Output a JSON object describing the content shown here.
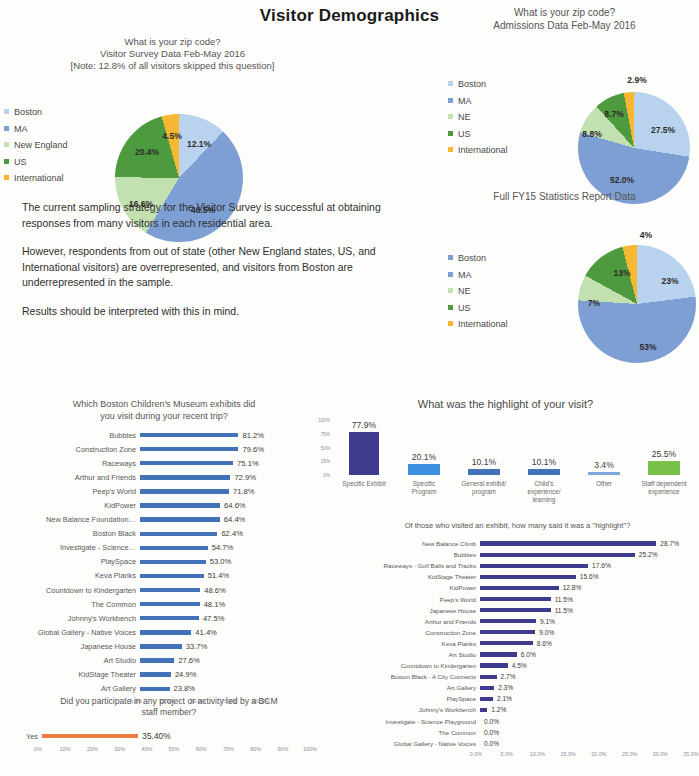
{
  "title": "Visitor Demographics",
  "colors": {
    "boston": "#b9d3ee",
    "ma": "#7e9fd4",
    "ne": "#c3e0b1",
    "us": "#4e9a3f",
    "international": "#f6b games",
    "intl": "#f7b731",
    "bar_blue": "#4472b8",
    "bar_navy": "#3f3b8f",
    "bar_green": "#78c24a",
    "bar_orange": "#ed7d42",
    "bar_brightblue": "#3f8fe0"
  },
  "pie_survey": {
    "chart_data": {
      "type": "pie",
      "title": "What is your zip code?\nVisitor Survey Data Feb-May 2016\n[Note: 12.8% of all visitors skipped this question]",
      "title_lines": [
        "What is your zip code?",
        "Visitor Survey Data Feb-May 2016",
        "[Note: 12.8% of all visitors skipped this question]"
      ],
      "categories": [
        "Boston",
        "MA",
        "New England",
        "US",
        "International"
      ],
      "values": [
        12.1,
        46.5,
        16.6,
        20.4,
        4.5
      ],
      "labels": [
        "12.1%",
        "46.5%",
        "16.6%",
        "20.4%",
        "4.5%"
      ],
      "colors": [
        "#b9d3ee",
        "#7e9fd4",
        "#c3e0b1",
        "#4e9a3f",
        "#f7b731"
      ],
      "legend": [
        "Boston",
        "MA",
        "New England",
        "US",
        "International"
      ],
      "legend_position": "left"
    }
  },
  "pie_admissions": {
    "chart_data": {
      "type": "pie",
      "title_lines": [
        "What is your zip code?",
        "Admissions Data Feb-May 2016"
      ],
      "categories": [
        "Boston",
        "MA",
        "NE",
        "US",
        "International"
      ],
      "values": [
        27.5,
        52.0,
        8.8,
        8.7,
        2.9
      ],
      "labels": [
        "27.5%",
        "52.0%",
        "8.8%",
        "8.7%",
        "2.9%"
      ],
      "colors": [
        "#b9d3ee",
        "#7e9fd4",
        "#c3e0b1",
        "#4e9a3f",
        "#f7b731"
      ],
      "legend": [
        "Boston",
        "MA",
        "NE",
        "US",
        "International"
      ],
      "legend_position": "left"
    }
  },
  "pie_fy15": {
    "chart_data": {
      "type": "pie",
      "title_lines": [
        "Full FY15 Statistics Report Data"
      ],
      "categories": [
        "Boston",
        "MA",
        "NE",
        "US",
        "International"
      ],
      "values": [
        23,
        53,
        7,
        13,
        4
      ],
      "labels": [
        "23%",
        "53%",
        "7%",
        "13%",
        "4%"
      ],
      "colors": [
        "#b9d3ee",
        "#7e9fd4",
        "#c3e0b1",
        "#4e9a3f",
        "#f7b731"
      ],
      "legend": [
        "Boston",
        "MA",
        "NE",
        "US",
        "International"
      ],
      "legend_position": "left"
    }
  },
  "narrative": {
    "p1": "The current sampling strategy for the Visitor Survey is successful at obtaining responses from many visitors in each residential area.",
    "p2": "However, respondents from out of state (other New England states, US, and International visitors) are overrepresented, and visitors from Boston are underrepresented in the sample.",
    "p3": "Results should be interpreted with this in mind."
  },
  "exhibits_visited": {
    "chart_data": {
      "type": "bar",
      "orientation": "horizontal",
      "title": "Which Boston Children's Museum exhibits did you visit during your recent trip?",
      "title_lines": [
        "Which Boston Children's Museum exhibits did",
        "you visit during your recent trip?"
      ],
      "categories": [
        "Bubbles",
        "Construction Zone",
        "Raceways",
        "Arthur and Friends",
        "Peep's World",
        "KidPower",
        "New Balance Foundation…",
        "Boston Black",
        "Investigate - Science…",
        "PlaySpace",
        "Keva Planks",
        "Countdown to Kindergarten",
        "The Common",
        "Johnny's Workbench",
        "Global Gallery - Native Voices",
        "Japanese House",
        "Art Studio",
        "KidStage Theater",
        "Art Gallery"
      ],
      "values": [
        81.2,
        79.6,
        75.1,
        72.9,
        71.8,
        64.6,
        64.4,
        62.4,
        54.7,
        53.0,
        51.4,
        48.6,
        48.1,
        47.5,
        41.4,
        33.7,
        27.6,
        24.9,
        23.8
      ],
      "value_labels": [
        "81.2%",
        "79.6%",
        "75.1%",
        "72.9%",
        "71.8%",
        "64.6%",
        "64.4%",
        "62.4%",
        "54.7%",
        "53.0%",
        "51.4%",
        "48.6%",
        "48.1%",
        "47.5%",
        "41.4%",
        "33.7%",
        "27.6%",
        "24.9%",
        "23.8%"
      ],
      "xticks": [
        "0.0%",
        "25.0%",
        "50.0%",
        "75.0%",
        "100.0%"
      ],
      "xtick_values": [
        0,
        25,
        50,
        75,
        100
      ],
      "xlim": [
        0,
        100
      ],
      "color": "#4472b8",
      "grid": false
    }
  },
  "bcm_staff": {
    "chart_data": {
      "type": "bar",
      "orientation": "horizontal",
      "title_lines": [
        "Did you participate in any project or activity led by a BCM",
        "staff member?"
      ],
      "categories": [
        "Yes"
      ],
      "values": [
        35.4
      ],
      "value_labels": [
        "35.40%"
      ],
      "xticks": [
        "0%",
        "10%",
        "20%",
        "30%",
        "40%",
        "50%",
        "60%",
        "70%",
        "80%",
        "90%",
        "100%"
      ],
      "xtick_values": [
        0,
        10,
        20,
        30,
        40,
        50,
        60,
        70,
        80,
        90,
        100
      ],
      "xlim": [
        0,
        100
      ],
      "color": "#ed7d42",
      "grid": false
    }
  },
  "highlight_visit": {
    "chart_data": {
      "type": "bar",
      "orientation": "vertical",
      "title": "What was the highlight of your visit?",
      "categories": [
        "Specific Exhibit",
        "Specific Program",
        "General exhibit/ program",
        "Child's experience/ learning",
        "Other",
        "Staff dependent experience"
      ],
      "category_lines": [
        [
          "Specific Exhibit"
        ],
        [
          "Specific",
          "Program"
        ],
        [
          "General exhibit/",
          "program"
        ],
        [
          "Child's",
          "experience/",
          "learning"
        ],
        [
          "Other"
        ],
        [
          "Staff dependent",
          "experience"
        ]
      ],
      "values": [
        77.9,
        20.1,
        10.1,
        10.1,
        3.4,
        25.5
      ],
      "value_labels": [
        "77.9%",
        "20.1%",
        "10.1%",
        "10.1%",
        "3.4%",
        "25.5%"
      ],
      "colors": [
        "#3f3b8f",
        "#3f8fe0",
        "#4472b8",
        "#4472b8",
        "#7fa8dd",
        "#78c24a"
      ],
      "yticks": [
        "100%",
        "75%",
        "50%",
        "25%",
        "0%"
      ],
      "ytick_values": [
        100,
        75,
        50,
        25,
        0
      ],
      "ylim": [
        0,
        100
      ],
      "grid": false
    }
  },
  "highlight_exhibits": {
    "chart_data": {
      "type": "bar",
      "orientation": "horizontal",
      "title": "Of those who visited an exhibit, how many said it was a \"highlight\"?",
      "categories": [
        "New Balance Climb",
        "Bubbles",
        "Raceways - Golf Balls and Tracks",
        "KidStage Theater",
        "KidPower",
        "Peep's World",
        "Japanese House",
        "Arthur and Friends",
        "Construction Zone",
        "Keva Planks",
        "Art Studio",
        "Countdown to Kindergarten",
        "Boston Black - A City Connects",
        "Art Gallery",
        "PlaySpace",
        "Johnny's Workbench",
        "Investigate - Science Playground",
        "The Common",
        "Global Gallery - Native Voices"
      ],
      "values": [
        28.7,
        25.2,
        17.6,
        15.6,
        12.8,
        11.5,
        11.5,
        9.1,
        9.0,
        8.6,
        6.0,
        4.5,
        2.7,
        2.3,
        2.1,
        1.2,
        0.0,
        0.0,
        0.0
      ],
      "value_labels": [
        "28.7%",
        "25.2%",
        "17.6%",
        "15.6%",
        "12.8%",
        "11.5%",
        "11.5%",
        "9.1%",
        "9.0%",
        "8.6%",
        "6.0%",
        "4.5%",
        "2.7%",
        "2.3%",
        "2.1%",
        "1.2%",
        "0.0%",
        "0.0%",
        "0.0%"
      ],
      "xticks": [
        "0.0%",
        "5.0%",
        "10.0%",
        "15.0%",
        "20.0%",
        "25.0%",
        "30.0%",
        "35.0%"
      ],
      "xtick_values": [
        0,
        5,
        10,
        15,
        20,
        25,
        30,
        35
      ],
      "xlim": [
        0,
        35
      ],
      "color": "#3f3b8f",
      "grid": false
    }
  }
}
